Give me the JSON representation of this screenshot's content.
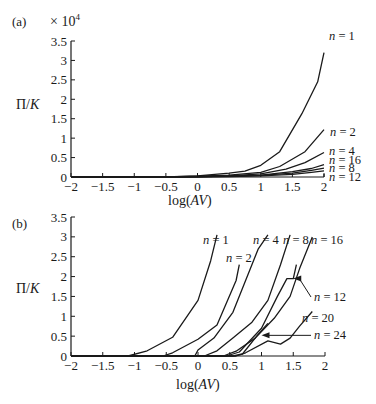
{
  "chart_data": [
    {
      "panel": "(a)",
      "type": "line",
      "title": "",
      "xlabel": "log(AV)",
      "ylabel": "Π/K",
      "y_multiplier": "× 10^4",
      "xlim": [
        -2,
        2
      ],
      "ylim": [
        0,
        3.5
      ],
      "xticks": [
        "−2",
        "−1.5",
        "−1",
        "−0.5",
        "0",
        "0.5",
        "1",
        "1.5",
        "2"
      ],
      "yticks": [
        "0",
        "0.5",
        "1",
        "1.5",
        "2",
        "2.5",
        "3",
        "3.5"
      ],
      "grid": false,
      "series": [
        {
          "name": "n = 1",
          "x": [
            -2,
            -0.5,
            0,
            0.5,
            0.75,
            1.0,
            1.3,
            1.65,
            1.9,
            2.0
          ],
          "y": [
            0,
            0,
            0.03,
            0.1,
            0.15,
            0.3,
            0.65,
            1.63,
            2.45,
            3.2
          ]
        },
        {
          "name": "n = 2",
          "x": [
            -2,
            -0.5,
            0,
            0.5,
            1.0,
            1.3,
            1.7,
            2.0
          ],
          "y": [
            0,
            0,
            0.02,
            0.05,
            0.12,
            0.27,
            0.65,
            1.22
          ]
        },
        {
          "name": "n = 4",
          "x": [
            -2,
            -0.5,
            0,
            0.5,
            1.0,
            1.4,
            1.7,
            2.0
          ],
          "y": [
            0,
            0,
            0.01,
            0.03,
            0.08,
            0.2,
            0.37,
            0.63
          ]
        },
        {
          "name": "n = 16",
          "x": [
            -2,
            -0.5,
            0,
            0.5,
            1.0,
            1.5,
            1.8,
            2.0
          ],
          "y": [
            0,
            0,
            0.01,
            0.02,
            0.05,
            0.14,
            0.22,
            0.32
          ]
        },
        {
          "name": "n = 8",
          "x": [
            -2,
            -0.5,
            0,
            0.5,
            1.0,
            1.5,
            1.8,
            2.0
          ],
          "y": [
            0,
            0,
            0.01,
            0.02,
            0.04,
            0.1,
            0.17,
            0.23
          ]
        },
        {
          "name": "n = 12",
          "x": [
            -2,
            -0.5,
            0,
            0.5,
            1.0,
            1.5,
            1.8,
            2.0
          ],
          "y": [
            0,
            0,
            0.0,
            0.01,
            0.03,
            0.07,
            0.12,
            0.16
          ]
        }
      ]
    },
    {
      "panel": "(b)",
      "type": "line",
      "title": "",
      "xlabel": "log(AV)",
      "ylabel": "Π/K",
      "xlim": [
        -2,
        2
      ],
      "ylim": [
        0,
        3.5
      ],
      "xticks": [
        "−2",
        "−1.5",
        "−1",
        "−0.5",
        "0",
        "0.5",
        "1",
        "1.5",
        "2"
      ],
      "yticks": [
        "0",
        "0.5",
        "1",
        "1.5",
        "2",
        "2.5",
        "3",
        "3.5"
      ],
      "grid": false,
      "series": [
        {
          "name": "n = 1",
          "x": [
            -2,
            -1.1,
            -0.8,
            -0.4,
            0.0,
            0.2,
            0.3
          ],
          "y": [
            0,
            0,
            0.13,
            0.47,
            1.4,
            2.4,
            3.05
          ]
        },
        {
          "name": "n = 2",
          "x": [
            -2,
            -0.55,
            -0.4,
            0.0,
            0.3,
            0.6,
            0.65
          ],
          "y": [
            0,
            0,
            0.08,
            0.42,
            0.78,
            1.9,
            2.3
          ]
        },
        {
          "name": "n = 4",
          "x": [
            -2,
            -0.05,
            0.0,
            0.25,
            0.55,
            0.75,
            0.95,
            1.1
          ],
          "y": [
            0,
            0,
            0.15,
            0.45,
            1.1,
            1.9,
            2.7,
            3.05
          ]
        },
        {
          "name": "n = 8",
          "x": [
            -2,
            0.1,
            0.3,
            0.55,
            0.85,
            1.1,
            1.3,
            1.45
          ],
          "y": [
            0,
            0,
            0.13,
            0.45,
            0.85,
            1.4,
            2.3,
            3.05
          ]
        },
        {
          "name": "n = 16",
          "x": [
            -2,
            0.4,
            0.6,
            0.9,
            1.2,
            1.45,
            1.6,
            1.8
          ],
          "y": [
            0,
            0,
            0.12,
            0.45,
            0.95,
            1.5,
            2.2,
            3.0
          ]
        },
        {
          "name": "n = 12",
          "x": [
            -2,
            0.45,
            0.65,
            1.0,
            1.25,
            1.4,
            1.5,
            1.55
          ],
          "y": [
            0,
            0,
            0.1,
            0.7,
            1.5,
            1.95,
            1.95,
            2.3
          ]
        },
        {
          "name": "n = 20",
          "x": [
            -2,
            0.6,
            0.75,
            1.1,
            1.3,
            1.45,
            1.6,
            1.8
          ],
          "y": [
            0,
            0,
            0.08,
            0.38,
            0.3,
            0.45,
            0.75,
            1.12
          ]
        },
        {
          "name": "n = 24",
          "x": [
            -2,
            0.55,
            0.7,
            0.95,
            1.1
          ],
          "y": [
            0,
            0,
            0.05,
            0.55,
            0.82
          ]
        }
      ],
      "annotations": [
        {
          "label": "n = 12",
          "arrow_to": [
            1.5,
            1.95
          ]
        },
        {
          "label": "n = 24",
          "arrow_to": [
            1.0,
            0.52
          ]
        }
      ]
    }
  ],
  "panels": {
    "a": {
      "tag": "(a)",
      "multiplier": "× 10",
      "multiplier_exp": "4",
      "ylabel_main": "Π/",
      "ylabel_ital": "K",
      "xlabel_main": "log(",
      "xlabel_ital": "AV",
      "xlabel_end": ")"
    },
    "b": {
      "tag": "(b)",
      "ylabel_main": "Π/",
      "ylabel_ital": "K",
      "xlabel_main": "log(",
      "xlabel_ital": "AV",
      "xlabel_end": ")"
    }
  }
}
